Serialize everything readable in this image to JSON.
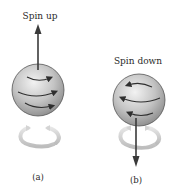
{
  "figure": {
    "panel_a": {
      "title": "Spin up",
      "caption": "(a)",
      "spin_direction": "up",
      "surface_arrows": "left-to-right",
      "rotation_ring": "counterclockwise (viewed from above)"
    },
    "panel_b": {
      "title": "Spin down",
      "caption": "(b)",
      "spin_direction": "down",
      "surface_arrows": "right-to-left",
      "rotation_ring": "clockwise (viewed from above)"
    },
    "colors": {
      "sphere_light": "#e8e8e8",
      "sphere_dark": "#8a8a8a",
      "arrow": "#3a3a3a",
      "ring": "#d0d0d0"
    }
  }
}
